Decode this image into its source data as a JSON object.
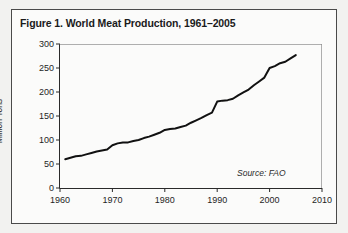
{
  "figure": {
    "title": "Figure 1. World Meat Production, 1961–2005",
    "source_note": "Source: FAO",
    "frame_color": "#4a4a4a",
    "card_background": "#fbfbfa",
    "page_background": "#f2f2f0"
  },
  "chart_data": {
    "type": "line",
    "title": "Figure 1. World Meat Production, 1961–2005",
    "xlabel": "",
    "ylabel": "Million Tons",
    "xlim": [
      1960,
      2010
    ],
    "ylim": [
      0,
      300
    ],
    "xticks": [
      1960,
      1970,
      1980,
      1990,
      2000,
      2010
    ],
    "xtick_labels": [
      "1960",
      "1970",
      "1980",
      "1990",
      "2000",
      "2010"
    ],
    "yticks": [
      0,
      50,
      100,
      150,
      200,
      250,
      300
    ],
    "ytick_labels": [
      "0",
      "50",
      "100",
      "150",
      "200",
      "250",
      "300"
    ],
    "grid": false,
    "legend": "none",
    "line_color": "#111111",
    "line_width": 2.0,
    "annotations": [
      {
        "text": "Source: FAO",
        "x": 2003,
        "ystyle": "italic",
        "position": "lower-right-inside"
      }
    ],
    "x": [
      1961,
      1962,
      1963,
      1964,
      1965,
      1966,
      1967,
      1968,
      1969,
      1970,
      1971,
      1972,
      1973,
      1974,
      1975,
      1976,
      1977,
      1978,
      1979,
      1980,
      1981,
      1982,
      1983,
      1984,
      1985,
      1986,
      1987,
      1988,
      1989,
      1990,
      1991,
      1992,
      1993,
      1994,
      1995,
      1996,
      1997,
      1998,
      1999,
      2000,
      2001,
      2002,
      2003,
      2004,
      2005
    ],
    "values": [
      60,
      63,
      66,
      67,
      70,
      73,
      76,
      78,
      80,
      89,
      93,
      95,
      95,
      98,
      100,
      104,
      107,
      111,
      115,
      121,
      123,
      124,
      127,
      130,
      136,
      141,
      146,
      152,
      157,
      180,
      182,
      183,
      186,
      193,
      199,
      205,
      214,
      222,
      230,
      250,
      254,
      260,
      263,
      270,
      277
    ],
    "series": [
      {
        "name": "World meat production",
        "unit": "Million Tons",
        "values": [
          60,
          63,
          66,
          67,
          70,
          73,
          76,
          78,
          80,
          89,
          93,
          95,
          95,
          98,
          100,
          104,
          107,
          111,
          115,
          121,
          123,
          124,
          127,
          130,
          136,
          141,
          146,
          152,
          157,
          180,
          182,
          183,
          186,
          193,
          199,
          205,
          214,
          222,
          230,
          250,
          254,
          260,
          263,
          270,
          277
        ]
      }
    ]
  }
}
